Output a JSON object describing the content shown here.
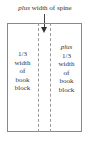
{
  "diagram": {
    "top_label": {
      "emphasis": "plus",
      "text": " width of spine"
    },
    "left_column": {
      "lines": [
        "1/3",
        "width",
        "of",
        "book",
        "block"
      ]
    },
    "right_column": {
      "emphasis": "plus",
      "lines": [
        "1/3",
        "width",
        "of",
        "book",
        "block"
      ]
    },
    "colors": {
      "border": "#888888",
      "dashed": "#999999",
      "arrow": "#333333",
      "text": "#333333"
    }
  }
}
